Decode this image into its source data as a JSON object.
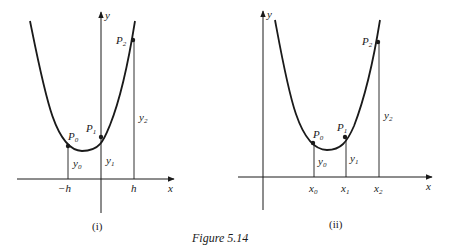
{
  "figure": {
    "caption": "Figure 5.14",
    "panels": [
      {
        "id": "i",
        "label": "(i)",
        "axis_x": "x",
        "axis_y": "y",
        "ticks": [
          "−h",
          "h"
        ],
        "points": [
          {
            "name": "P",
            "sub": "0"
          },
          {
            "name": "P",
            "sub": "1"
          },
          {
            "name": "P",
            "sub": "2"
          }
        ],
        "ordinates": [
          {
            "name": "y",
            "sub": "0"
          },
          {
            "name": "y",
            "sub": "1"
          },
          {
            "name": "y",
            "sub": "2"
          }
        ]
      },
      {
        "id": "ii",
        "label": "(ii)",
        "axis_x": "x",
        "axis_y": "y",
        "ticks": [
          {
            "name": "x",
            "sub": "0"
          },
          {
            "name": "x",
            "sub": "1"
          },
          {
            "name": "x",
            "sub": "2"
          }
        ],
        "points": [
          {
            "name": "P",
            "sub": "0"
          },
          {
            "name": "P",
            "sub": "1"
          },
          {
            "name": "P",
            "sub": "2"
          }
        ],
        "ordinates": [
          {
            "name": "y",
            "sub": "0"
          },
          {
            "name": "y",
            "sub": "1"
          },
          {
            "name": "y",
            "sub": "2"
          }
        ]
      }
    ]
  },
  "colors": {
    "ink": "#1a1a1a",
    "background": "#ffffff"
  }
}
